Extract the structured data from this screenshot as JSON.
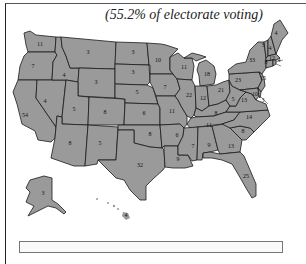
{
  "caption": "(55.2% of electorate voting)",
  "map": {
    "fill_color": "#9a9a9a",
    "border_color": "#1a1a1a",
    "states": [
      {
        "name": "Washington",
        "ev": "11",
        "x": 40,
        "y": 46
      },
      {
        "name": "Oregon",
        "ev": "7",
        "x": 33,
        "y": 68
      },
      {
        "name": "California",
        "ev": "54",
        "x": 25,
        "y": 117
      },
      {
        "name": "Idaho",
        "ev": "4",
        "x": 64,
        "y": 77
      },
      {
        "name": "Nevada",
        "ev": "4",
        "x": 45,
        "y": 103
      },
      {
        "name": "Montana",
        "ev": "3",
        "x": 88,
        "y": 54
      },
      {
        "name": "Wyoming",
        "ev": "3",
        "x": 96,
        "y": 84
      },
      {
        "name": "Utah",
        "ev": "5",
        "x": 74,
        "y": 111
      },
      {
        "name": "Colorado",
        "ev": "8",
        "x": 105,
        "y": 114
      },
      {
        "name": "Arizona",
        "ev": "8",
        "x": 70,
        "y": 145
      },
      {
        "name": "New Mexico",
        "ev": "5",
        "x": 100,
        "y": 145
      },
      {
        "name": "North Dakota",
        "ev": "3",
        "x": 133,
        "y": 54
      },
      {
        "name": "South Dakota",
        "ev": "3",
        "x": 133,
        "y": 74
      },
      {
        "name": "Nebraska",
        "ev": "5",
        "x": 137,
        "y": 94
      },
      {
        "name": "Kansas",
        "ev": "6",
        "x": 144,
        "y": 115
      },
      {
        "name": "Oklahoma",
        "ev": "8",
        "x": 150,
        "y": 136
      },
      {
        "name": "Texas",
        "ev": "32",
        "x": 140,
        "y": 167
      },
      {
        "name": "Minnesota",
        "ev": "10",
        "x": 158,
        "y": 62
      },
      {
        "name": "Iowa",
        "ev": "7",
        "x": 165,
        "y": 89
      },
      {
        "name": "Missouri",
        "ev": "11",
        "x": 172,
        "y": 113
      },
      {
        "name": "Arkansas",
        "ev": "6",
        "x": 177,
        "y": 137
      },
      {
        "name": "Louisiana",
        "ev": "9",
        "x": 178,
        "y": 161
      },
      {
        "name": "Wisconsin",
        "ev": "11",
        "x": 184,
        "y": 69
      },
      {
        "name": "Illinois",
        "ev": "22",
        "x": 189,
        "y": 97
      },
      {
        "name": "Michigan",
        "ev": "18",
        "x": 207,
        "y": 76
      },
      {
        "name": "Indiana",
        "ev": "12",
        "x": 203,
        "y": 100
      },
      {
        "name": "Ohio",
        "ev": "21",
        "x": 221,
        "y": 92
      },
      {
        "name": "Kentucky",
        "ev": "8",
        "x": 216,
        "y": 115
      },
      {
        "name": "Tennessee",
        "ev": "11",
        "x": 209,
        "y": 127
      },
      {
        "name": "Mississippi",
        "ev": "7",
        "x": 193,
        "y": 148
      },
      {
        "name": "Alabama",
        "ev": "9",
        "x": 209,
        "y": 147
      },
      {
        "name": "Georgia",
        "ev": "13",
        "x": 231,
        "y": 148
      },
      {
        "name": "Florida",
        "ev": "25",
        "x": 246,
        "y": 178
      },
      {
        "name": "South Carolina",
        "ev": "8",
        "x": 243,
        "y": 133
      },
      {
        "name": "North Carolina",
        "ev": "14",
        "x": 249,
        "y": 119
      },
      {
        "name": "Virginia",
        "ev": "13",
        "x": 244,
        "y": 102
      },
      {
        "name": "West Virginia",
        "ev": "5",
        "x": 233,
        "y": 101
      },
      {
        "name": "Pennsylvania",
        "ev": "23",
        "x": 238,
        "y": 82
      },
      {
        "name": "New York",
        "ev": "33",
        "x": 252,
        "y": 62
      },
      {
        "name": "Maryland",
        "ev": "10",
        "x": 255,
        "y": 96
      },
      {
        "name": "Delaware",
        "ev": "3",
        "x": 263,
        "y": 102
      },
      {
        "name": "New Jersey",
        "ev": "15",
        "x": 263,
        "y": 80
      },
      {
        "name": "Vermont",
        "ev": "3",
        "x": 263,
        "y": 47
      },
      {
        "name": "New Hampshire",
        "ev": "4",
        "x": 270,
        "y": 50
      },
      {
        "name": "Maine",
        "ev": "4",
        "x": 276,
        "y": 35
      },
      {
        "name": "Massachusetts",
        "ev": "12",
        "x": 272,
        "y": 60
      },
      {
        "name": "Rhode Island",
        "ev": "4",
        "x": 279,
        "y": 62
      },
      {
        "name": "Connecticut",
        "ev": "8",
        "x": 266,
        "y": 64
      },
      {
        "name": "Alaska",
        "ev": "3",
        "x": 43,
        "y": 195
      },
      {
        "name": "Hawaii",
        "ev": "4",
        "x": 126,
        "y": 217
      }
    ]
  }
}
